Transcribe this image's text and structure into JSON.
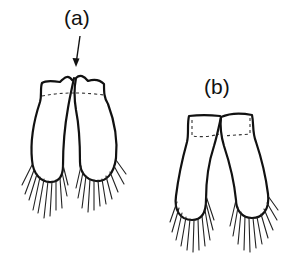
{
  "figure": {
    "panels": [
      {
        "id": "a",
        "label": "(a)",
        "description": "Two lobes (petals) joined at apex with an arrow pointing to the notch at the top junction; fringed bristles at bottom",
        "has_arrow": true
      },
      {
        "id": "b",
        "label": "(b)",
        "description": "Two lobes joined at flat top, diverging downward; fringed bristles at bottom",
        "has_arrow": false
      }
    ],
    "colors": {
      "line": "#111111",
      "background": "#ffffff"
    }
  }
}
